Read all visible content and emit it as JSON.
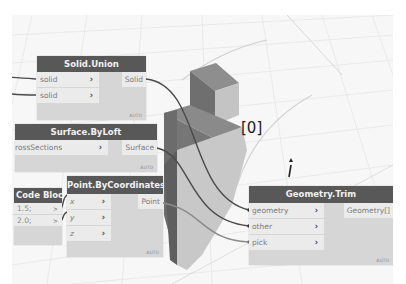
{
  "nodes": {
    "solid_union": {
      "title": "Solid.Union",
      "inputs": [
        {
          "label": "solid"
        },
        {
          "label": "solid"
        }
      ],
      "output": "Solid",
      "lacing": "AUTO"
    },
    "surface_byloft": {
      "title": "Surface.ByLoft",
      "inputs": [
        {
          "label": "rossSections"
        }
      ],
      "output": "Surface",
      "lacing": "AUTO"
    },
    "code_block": {
      "title": "Code Block",
      "lines": [
        "1.5;",
        "2.0;"
      ]
    },
    "point_bycoordinates": {
      "title": "Point.ByCoordinates",
      "inputs": [
        {
          "label": "x"
        },
        {
          "label": "y"
        },
        {
          "label": "z"
        }
      ],
      "output": "Point",
      "lacing": "AUTO"
    },
    "geometry_trim": {
      "title": "Geometry.Trim",
      "inputs": [
        {
          "label": "geometry"
        },
        {
          "label": "other"
        },
        {
          "label": "pick"
        }
      ],
      "output": "Geometry[]",
      "lacing": "AUTO"
    }
  },
  "viewport": {
    "index_label": "[0]"
  },
  "icons": {
    "port_chevron": "›",
    "code_arrow": ">"
  },
  "colors": {
    "node_header": "#585858",
    "node_body": "#d6d6d6",
    "port_bg": "#ebebeb",
    "wire": "#4a4a4a",
    "canvas": "#f7f7f7"
  }
}
